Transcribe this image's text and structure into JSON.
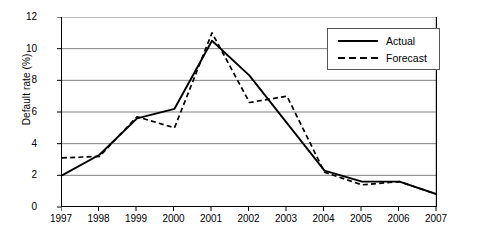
{
  "chart_data": {
    "type": "line",
    "title": "",
    "xlabel": "",
    "ylabel": "Default rate (%)",
    "categories": [
      "1997",
      "1998",
      "1999",
      "2000",
      "2001",
      "2002",
      "2003",
      "2004",
      "2005",
      "2006",
      "2007"
    ],
    "x": [
      1997,
      1998,
      1999,
      2000,
      2001,
      2002,
      2003,
      2004,
      2005,
      2006,
      2007
    ],
    "series": [
      {
        "name": "Actual",
        "style": "solid",
        "values": [
          2.0,
          3.3,
          5.6,
          6.2,
          10.5,
          8.3,
          5.3,
          2.3,
          1.6,
          1.6,
          0.8
        ]
      },
      {
        "name": "Forecast",
        "style": "dashed",
        "values": [
          3.1,
          3.2,
          5.7,
          5.0,
          11.0,
          6.6,
          7.0,
          2.2,
          1.4,
          1.6,
          0.8
        ]
      }
    ],
    "ylim": [
      0,
      12
    ],
    "yticks": [
      0,
      2,
      4,
      6,
      8,
      10,
      12
    ],
    "ytick_labels": [
      "0",
      "2",
      "4",
      "6",
      "8",
      "10",
      "12"
    ],
    "grid": "horizontal",
    "legend_position": "top-right",
    "colors": {
      "line": "#000000",
      "grid": "#808080",
      "axis": "#000000",
      "background": "#ffffff"
    }
  }
}
